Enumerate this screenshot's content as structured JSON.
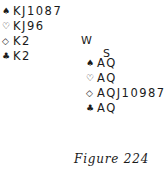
{
  "west": {
    "label": "W",
    "spades": {
      "icon": "♠",
      "cards": "KJ1087"
    },
    "hearts": {
      "icon": "♡",
      "cards": "KJ96"
    },
    "diamonds": {
      "icon": "◇",
      "cards": "K2"
    },
    "clubs": {
      "icon": "♣",
      "cards": "K2"
    }
  },
  "south": {
    "label": "S",
    "spades": {
      "icon": "♠",
      "cards": "AQ"
    },
    "hearts": {
      "icon": "♡",
      "cards": "AQ"
    },
    "diamonds": {
      "icon": "◇",
      "cards": "AQJ10987"
    },
    "clubs": {
      "icon": "♣",
      "cards": "AQ"
    }
  },
  "caption": "Figure 224"
}
